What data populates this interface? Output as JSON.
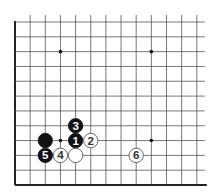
{
  "diagram": {
    "type": "go-board-partial",
    "corner": "bottom-left",
    "columns": 13,
    "rows": 12,
    "origin": {
      "x": 15,
      "y": 22
    },
    "spacing": {
      "x": 15.15,
      "y": 14.82
    },
    "line_color": "#555555",
    "edge_color": "#222222",
    "star_points": [
      {
        "col": 3,
        "row": 2
      },
      {
        "col": 9,
        "row": 2
      },
      {
        "col": 3,
        "row": 8
      },
      {
        "col": 9,
        "row": 8
      }
    ],
    "stones": [
      {
        "color": "black",
        "col": 2,
        "row": 8,
        "label": ""
      },
      {
        "color": "black",
        "col": 4,
        "row": 8,
        "label": "1"
      },
      {
        "color": "white",
        "col": 5,
        "row": 8,
        "label": "2"
      },
      {
        "color": "black",
        "col": 4,
        "row": 7,
        "label": "3"
      },
      {
        "color": "white",
        "col": 3,
        "row": 9,
        "label": "4"
      },
      {
        "color": "black",
        "col": 2,
        "row": 9,
        "label": "5"
      },
      {
        "color": "white",
        "col": 8,
        "row": 9,
        "label": "6"
      },
      {
        "color": "white",
        "col": 4,
        "row": 9,
        "label": ""
      }
    ]
  }
}
